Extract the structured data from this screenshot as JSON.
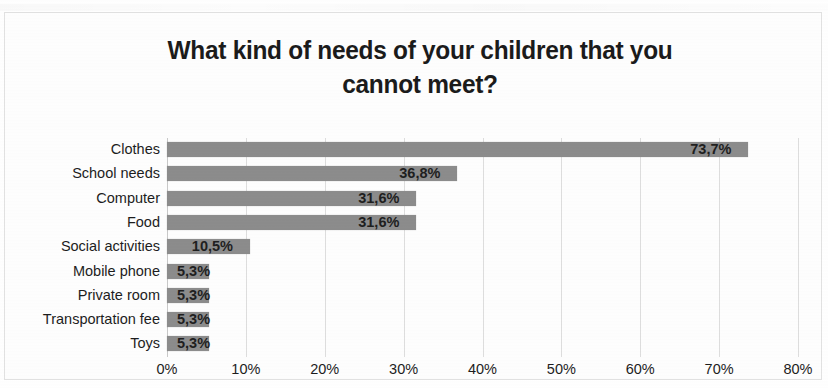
{
  "chart_data": {
    "type": "bar",
    "orientation": "horizontal",
    "title": "What kind of needs of your children that you cannot meet?",
    "title_line1": "What kind of needs of your children that you",
    "title_line2": "cannot meet?",
    "xlabel": "",
    "ylabel": "",
    "categories": [
      "Clothes",
      "School needs",
      "Computer",
      "Food",
      "Social activities",
      "Mobile phone",
      "Private room",
      "Transportation fee",
      "Toys"
    ],
    "values": [
      73.7,
      36.8,
      31.6,
      31.6,
      10.5,
      5.3,
      5.3,
      5.3,
      5.3
    ],
    "data_labels": [
      "73,7%",
      "36,8%",
      "31,6%",
      "31,6%",
      "10,5%",
      "5,3%",
      "5,3%",
      "5,3%",
      "5,3%"
    ],
    "xlim": [
      0,
      80
    ],
    "xtick_values": [
      0,
      10,
      20,
      30,
      40,
      50,
      60,
      70,
      80
    ],
    "xtick_labels": [
      "0%",
      "10%",
      "20%",
      "30%",
      "40%",
      "50%",
      "60%",
      "70%",
      "80%"
    ],
    "grid": true,
    "grid_axis": "x",
    "legend": false,
    "bar_color": "#8c8c8c",
    "grid_color": "#dedede",
    "text_color": "#1d1d1d",
    "background_color": "#ffffff"
  }
}
